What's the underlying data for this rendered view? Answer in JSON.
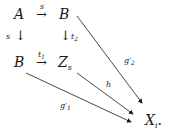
{
  "diagram": {
    "type": "commutative-diagram",
    "nodes": {
      "a": {
        "label": "A"
      },
      "b_top": {
        "label": "B"
      },
      "b_bottom": {
        "label": "B"
      },
      "z": {
        "label": "Z",
        "sub": "s"
      },
      "x": {
        "label": "X",
        "sub": "i",
        "suffix": "."
      }
    },
    "arrows": {
      "a_to_b": {
        "label": "s",
        "glyph": "→"
      },
      "a_to_b_down": {
        "label": "s",
        "glyph": "↓"
      },
      "b_to_z_down": {
        "label": "t",
        "sub": "2",
        "glyph": "↓"
      },
      "b_to_z": {
        "label": "t",
        "sub": "1",
        "glyph": "→"
      },
      "b_to_x": {
        "label": "g",
        "prime": "′",
        "sub": "2"
      },
      "z_to_x": {
        "label": "h"
      },
      "bb_to_x": {
        "label": "g",
        "prime": "′",
        "sub": "1"
      }
    },
    "colors": {
      "ink": "#1a1a1a",
      "background": "#ffffff"
    }
  }
}
